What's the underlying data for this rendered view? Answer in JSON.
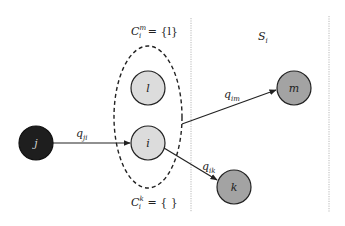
{
  "diagram": {
    "type": "graph",
    "colors": {
      "background": "#ffffff",
      "dark_node": "#1e1e1e",
      "light_node": "#dcdcdc",
      "mid_node": "#a3a3a3",
      "stroke": "#222222",
      "divider": "#b8b8b8"
    },
    "nodes": [
      {
        "id": "j",
        "label": "j",
        "shade": "dark"
      },
      {
        "id": "l",
        "label": "l",
        "shade": "light"
      },
      {
        "id": "i",
        "label": "i",
        "shade": "light"
      },
      {
        "id": "m",
        "label": "m",
        "shade": "mid"
      },
      {
        "id": "k",
        "label": "k",
        "shade": "mid"
      }
    ],
    "edges": [
      {
        "from": "j",
        "to": "i",
        "label_base": "q",
        "label_sub": "ji"
      },
      {
        "from": "cluster",
        "to": "m",
        "label_base": "q",
        "label_sub": "im"
      },
      {
        "from": "i",
        "to": "k",
        "label_base": "q",
        "label_sub": "ik"
      }
    ],
    "cluster": {
      "members": [
        "l",
        "i"
      ],
      "top_label": {
        "base": "C",
        "sub": "i",
        "sup": "m",
        "rest": " = {l}"
      },
      "bottom_label": {
        "base": "C",
        "sub": "i",
        "sup": "k",
        "rest": " = { }"
      }
    },
    "region": {
      "label_base": "S",
      "label_sub": "i"
    }
  }
}
